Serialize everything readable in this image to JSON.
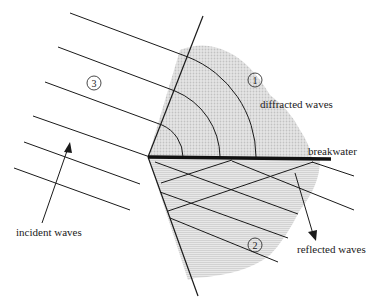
{
  "diagram": {
    "labels": {
      "diffracted": "diffracted waves",
      "breakwater": "breakwater",
      "reflected": "reflected waves",
      "incident": "incident waves"
    },
    "regions": {
      "r1": "1",
      "r2": "2",
      "r3": "3"
    },
    "colors": {
      "line": "#1a1a1a",
      "shade_diffracted": "#d4d4d4",
      "shade_reflected": "#dcdcdc",
      "background": "#ffffff"
    }
  }
}
